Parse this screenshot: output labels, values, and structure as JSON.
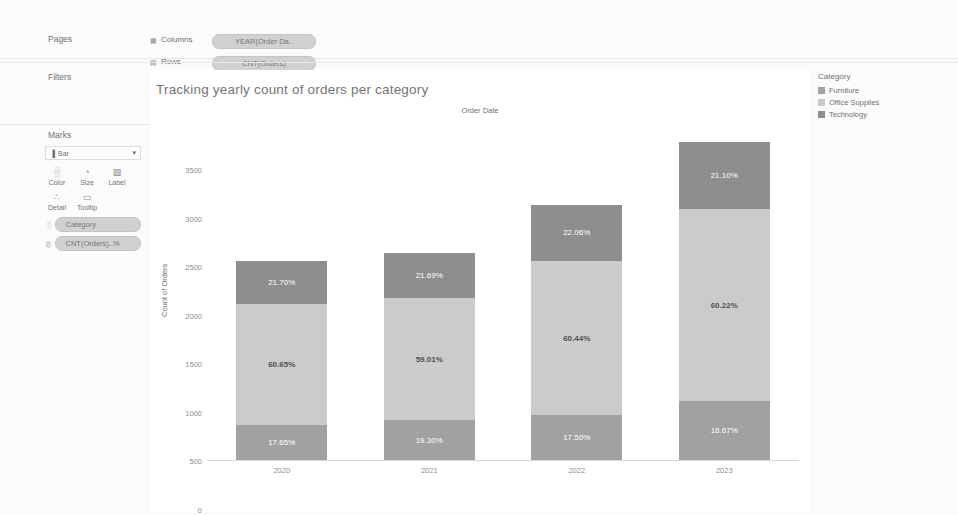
{
  "app": {
    "shelves": {
      "columns_label": "Columns",
      "rows_label": "Rows",
      "columns_pill": "YEAR(Order Da..",
      "rows_pill": "CNT(Orders)",
      "columns_icon": "grid-columns-icon",
      "rows_icon": "grid-rows-icon"
    },
    "left_panel": {
      "pages_label": "Pages",
      "filters_label": "Filters",
      "marks_label": "Marks",
      "mark_type": "Bar",
      "mark_type_caret": "▾",
      "mark_type_icon": "▐",
      "buttons": [
        {
          "label": "Color",
          "glyph": "░",
          "name": "color"
        },
        {
          "label": "Size",
          "glyph": "◔",
          "name": "size"
        },
        {
          "label": "Label",
          "glyph": "▧",
          "name": "label"
        },
        {
          "label": "Detail",
          "glyph": "∴",
          "name": "detail"
        },
        {
          "label": "Tooltip",
          "glyph": "▭",
          "name": "tooltip"
        }
      ],
      "mark_pills": [
        {
          "label": "Category",
          "icon": "░"
        },
        {
          "label": "CNT(Orders)..%",
          "icon": "Ⓓ"
        }
      ]
    },
    "legend": {
      "title": "Category",
      "items": [
        {
          "label": "Furniture",
          "color": "#9e9e9e"
        },
        {
          "label": "Office Supplies",
          "color": "#c9c9c9"
        },
        {
          "label": "Technology",
          "color": "#8a8a8a"
        }
      ]
    }
  },
  "chart_data": {
    "type": "bar",
    "stacked": true,
    "title": "Tracking yearly count of orders per category",
    "column_header": "Order Date",
    "xlabel": "",
    "ylabel": "Count of Orders",
    "categories": [
      "2020",
      "2021",
      "2022",
      "2023"
    ],
    "ylim": [
      0,
      3500
    ],
    "yticks": [
      0,
      500,
      1000,
      1500,
      2000,
      2500,
      3000,
      3500
    ],
    "ytick_labels": [
      "0",
      "500",
      "1000",
      "1500",
      "2000",
      "2500",
      "3000",
      "3500"
    ],
    "grid": false,
    "legend_position": "right",
    "totals": [
      2050,
      2130,
      2630,
      3270
    ],
    "series": [
      {
        "name": "Furniture",
        "color": "#9e9e9e",
        "values": [
          362,
          411,
          460,
          610
        ],
        "labels": [
          "17.65%",
          "19.30%",
          "17.50%",
          "18.67%"
        ],
        "percent": [
          17.65,
          19.3,
          17.5,
          18.67
        ]
      },
      {
        "name": "Office Supplies",
        "color": "#c9c9c9",
        "values": [
          1243,
          1257,
          1590,
          1969
        ],
        "labels": [
          "60.65%",
          "59.01%",
          "60.44%",
          "60.22%"
        ],
        "percent": [
          60.65,
          59.01,
          60.44,
          60.22
        ]
      },
      {
        "name": "Technology",
        "color": "#8a8a8a",
        "values": [
          445,
          462,
          580,
          690
        ],
        "labels": [
          "21.70%",
          "21.69%",
          "22.06%",
          "21.10%"
        ],
        "percent": [
          21.7,
          21.69,
          22.06,
          21.1
        ]
      }
    ]
  }
}
